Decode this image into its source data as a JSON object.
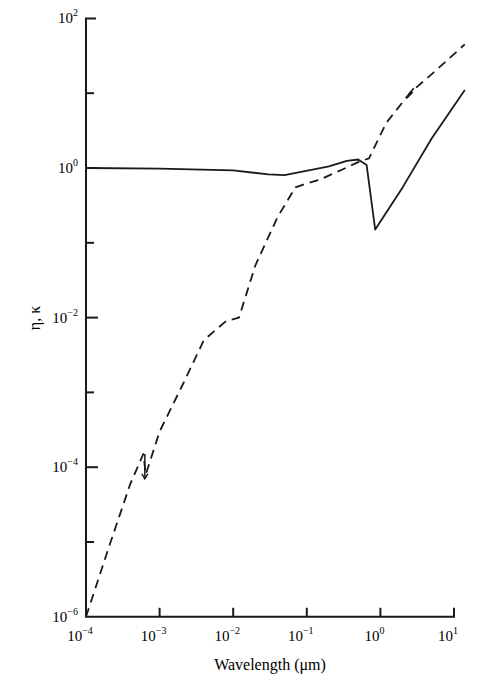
{
  "chart_data": {
    "type": "line",
    "title": "",
    "xlabel": "Wavelength (μm)",
    "ylabel": "η, κ",
    "xscale": "log",
    "yscale": "log",
    "xlim": [
      0.0001,
      10
    ],
    "ylim": [
      1e-06,
      100
    ],
    "grid": false,
    "legend": null,
    "x_ticks": [
      {
        "base": "10",
        "exp": "−4"
      },
      {
        "base": "10",
        "exp": "−3"
      },
      {
        "base": "10",
        "exp": "−2"
      },
      {
        "base": "10",
        "exp": "−1"
      },
      {
        "base": "10",
        "exp": "0"
      },
      {
        "base": "10",
        "exp": "1"
      }
    ],
    "y_ticks": [
      {
        "base": "10",
        "exp": "2"
      },
      {
        "base": "10",
        "exp": "0"
      },
      {
        "base": "10",
        "exp": "−2"
      },
      {
        "base": "10",
        "exp": "−4"
      },
      {
        "base": "10",
        "exp": "−6"
      }
    ],
    "series": [
      {
        "name": "η (refractive index, solid)",
        "style": "solid",
        "x": [
          0.0001,
          0.001,
          0.01,
          0.03,
          0.05,
          0.08,
          0.12,
          0.2,
          0.35,
          0.5,
          0.65,
          0.85,
          2,
          5,
          14
        ],
        "y": [
          1.0,
          0.98,
          0.93,
          0.82,
          0.8,
          0.88,
          0.95,
          1.05,
          1.25,
          1.3,
          1.1,
          0.15,
          0.55,
          2.5,
          11
        ]
      },
      {
        "name": "κ (extinction coefficient, dashed)",
        "style": "dashed",
        "x": [
          0.0001,
          0.0002,
          0.0004,
          0.0006,
          0.00065,
          0.001,
          0.002,
          0.004,
          0.008,
          0.012,
          0.02,
          0.04,
          0.07,
          0.09,
          0.15,
          0.3,
          0.5,
          0.7,
          1.2,
          2.5,
          5,
          14
        ],
        "y": [
          1e-06,
          8e-06,
          6e-05,
          0.00015,
          8e-05,
          0.0003,
          0.0012,
          0.005,
          0.009,
          0.01,
          0.05,
          0.22,
          0.55,
          0.6,
          0.7,
          0.95,
          1.2,
          1.35,
          4,
          10,
          18,
          45
        ]
      }
    ],
    "annotations": [
      {
        "text": "arrow marker on κ near 6×10⁻⁴ μm",
        "x": 0.00063,
        "y": 0.0001
      },
      {
        "text": "break marker on κ near 2.5 μm",
        "x": 2.5,
        "y": 10
      }
    ]
  }
}
